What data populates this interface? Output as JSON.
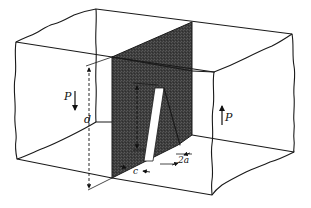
{
  "figure": {
    "colors": {
      "line": "#1a1a1a",
      "panel_dark": "#3f3f3f",
      "panel_top": "#4a4a4a",
      "notch": "#ffffff",
      "background": "#ffffff"
    },
    "labels": {
      "load_left": "P",
      "load_right": "P",
      "depth": "d",
      "crack_offset": "c",
      "notch_width": "2a"
    }
  }
}
